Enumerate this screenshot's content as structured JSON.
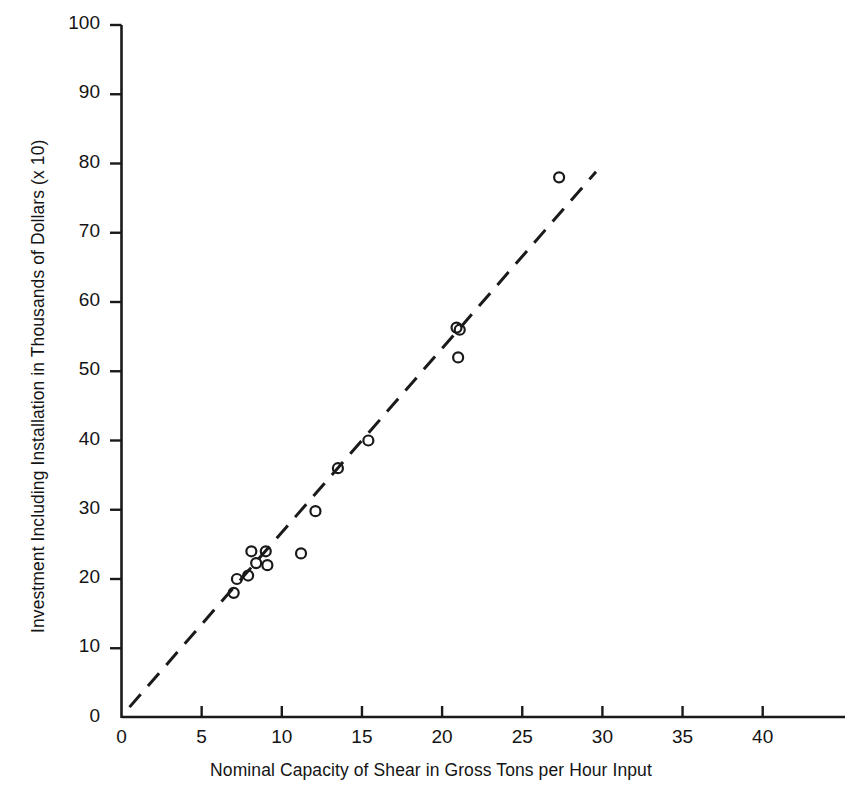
{
  "chart_data": {
    "type": "scatter",
    "title": "",
    "subtitle": "",
    "xlabel": "Nominal Capacity of Shear in Gross Tons per Hour Input",
    "ylabel": "Investment Including Installation in Thousands of Dollars (x 10)",
    "xlim": [
      0,
      45
    ],
    "ylim": [
      0,
      100
    ],
    "xticks": [
      0,
      5,
      10,
      15,
      20,
      25,
      30,
      35,
      40
    ],
    "xtick_labels": [
      "0",
      "5",
      "10",
      "15",
      "20",
      "25",
      "30",
      "35",
      "40"
    ],
    "yticks": [
      0,
      10,
      20,
      30,
      40,
      50,
      60,
      70,
      80,
      90,
      100
    ],
    "ytick_labels": [
      "0",
      "10",
      "20",
      "30",
      "40",
      "50",
      "60",
      "70",
      "80",
      "90",
      "100"
    ],
    "grid": false,
    "legend": "none",
    "marker": "open-circle",
    "marker_color": "#1a1a1a",
    "marker_radius": 5,
    "points": [
      {
        "x": 7.0,
        "y": 18.0
      },
      {
        "x": 7.2,
        "y": 20.0
      },
      {
        "x": 7.9,
        "y": 20.5
      },
      {
        "x": 8.1,
        "y": 24.0
      },
      {
        "x": 8.4,
        "y": 22.3
      },
      {
        "x": 9.0,
        "y": 24.0
      },
      {
        "x": 9.1,
        "y": 22.0
      },
      {
        "x": 11.2,
        "y": 23.7
      },
      {
        "x": 12.1,
        "y": 29.8
      },
      {
        "x": 13.5,
        "y": 36.0
      },
      {
        "x": 15.4,
        "y": 40.0
      },
      {
        "x": 20.9,
        "y": 56.3
      },
      {
        "x": 21.1,
        "y": 56.0
      },
      {
        "x": 21.0,
        "y": 52.0
      },
      {
        "x": 27.3,
        "y": 78.0
      }
    ],
    "trendline": {
      "style": "dashed",
      "color": "#1a1a1a",
      "x_start": 0.5,
      "y_start": 1.5,
      "x_end": 29.6,
      "y_end": 78.8
    }
  },
  "axes": {
    "x_axis_name": "x-axis",
    "y_axis_name": "y-axis",
    "axis_color": "#1a1a1a"
  }
}
